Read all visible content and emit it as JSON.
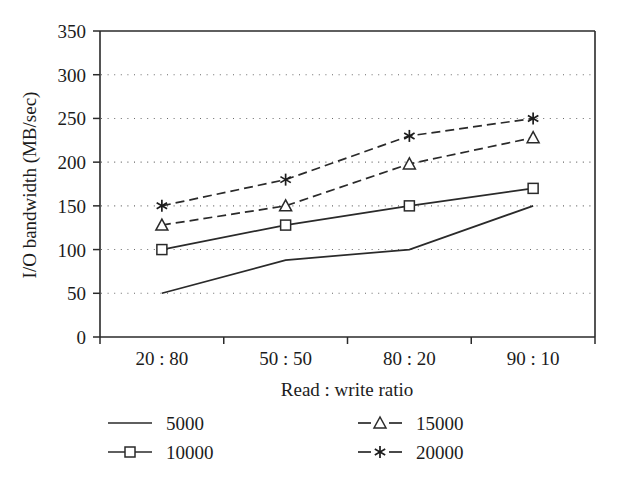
{
  "chart_data": {
    "type": "line",
    "title": "",
    "xlabel": "Read : write ratio",
    "ylabel": "I/O bandwidth (MB/sec)",
    "categories": [
      "20:80",
      "50:50",
      "80:20",
      "90:10"
    ],
    "category_labels_display": [
      "20 : 80",
      "50 : 50",
      "80 : 20",
      "90 : 10"
    ],
    "ylim": [
      0,
      350
    ],
    "yticks": [
      0,
      50,
      100,
      150,
      200,
      250,
      300,
      350
    ],
    "ytick_labels": [
      "0",
      "50",
      "100",
      "150",
      "200",
      "250",
      "300",
      "350"
    ],
    "grid": "horizontal-dotted",
    "legend_position": "below-plot",
    "series": [
      {
        "name": "5000",
        "values": [
          50,
          88,
          100,
          150
        ],
        "line_style": "solid",
        "marker": "none"
      },
      {
        "name": "10000",
        "values": [
          100,
          128,
          150,
          170
        ],
        "line_style": "solid",
        "marker": "square-open"
      },
      {
        "name": "15000",
        "values": [
          128,
          150,
          198,
          228
        ],
        "line_style": "dashed",
        "marker": "triangle-open"
      },
      {
        "name": "20000",
        "values": [
          150,
          180,
          230,
          250
        ],
        "line_style": "dashed",
        "marker": "asterisk"
      }
    ]
  },
  "legend": {
    "entries": [
      {
        "label": "5000",
        "style": "solid",
        "marker": "none"
      },
      {
        "label": "10000",
        "style": "solid",
        "marker": "square-open"
      },
      {
        "label": "15000",
        "style": "dashed",
        "marker": "triangle-open"
      },
      {
        "label": "20000",
        "style": "dashed",
        "marker": "asterisk"
      }
    ]
  },
  "colors": {
    "ink": "#1c1c1c",
    "axis": "#2a2a2a",
    "grid": "#6a6a6a",
    "background": "#ffffff"
  }
}
